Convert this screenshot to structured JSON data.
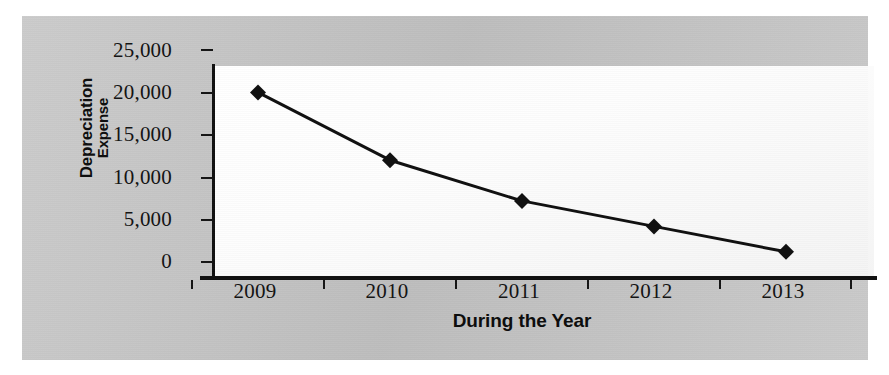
{
  "chart_data": {
    "type": "line",
    "title": "",
    "xlabel": "During the Year",
    "ylabel": "Depreciation Expense",
    "ylabel_line1": "Depreciation",
    "ylabel_line2": "Expense",
    "categories": [
      "2009",
      "2010",
      "2011",
      "2012",
      "2013"
    ],
    "values": [
      20000,
      12000,
      7200,
      4200,
      1200
    ],
    "series": [
      {
        "name": "Depreciation Expense",
        "values": [
          20000,
          12000,
          7200,
          4200,
          1200
        ]
      }
    ],
    "ylim": [
      0,
      25000
    ],
    "ytick_labels": [
      "25,000",
      "20,000",
      "15,000",
      "10,000",
      "5,000",
      "0"
    ],
    "ytick_values": [
      25000,
      20000,
      15000,
      10000,
      5000,
      0
    ],
    "xtick_labels": [
      "2009",
      "2010",
      "2011",
      "2012",
      "2013"
    ],
    "grid": false,
    "legend": "none",
    "marker": "diamond",
    "line_color": "#111111",
    "marker_color": "#111111",
    "plot_background": "#ffffff",
    "figure_background": "#c6c6c6"
  }
}
